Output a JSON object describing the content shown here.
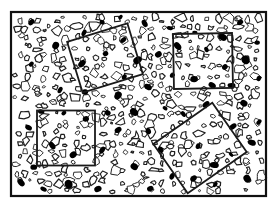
{
  "figure": {
    "background_color": "#ffffff",
    "ink_color": "#1a1a1a",
    "fill_color": "#000000",
    "canvas": {
      "width": 279,
      "height": 209
    },
    "outer_frame": {
      "label": "outer frame",
      "x": 11,
      "y": 12,
      "width": 255,
      "height": 184,
      "stroke_width": 2.2,
      "stroke_color": "#111111"
    },
    "sampling_windows": [
      {
        "name": "window-top-left",
        "label": "A",
        "cx": 105,
        "cy": 58,
        "width": 63,
        "height": 53,
        "rotation": -17,
        "stroke_width": 1.8
      },
      {
        "name": "window-top-right",
        "label": "B",
        "cx": 203,
        "cy": 61,
        "width": 59,
        "height": 55,
        "rotation": -1,
        "stroke_width": 1.8
      },
      {
        "name": "window-bottom-left",
        "label": "C",
        "cx": 66,
        "cy": 138,
        "width": 58,
        "height": 55,
        "rotation": 0,
        "stroke_width": 1.8
      },
      {
        "name": "window-bottom-right",
        "label": "D",
        "cx": 200,
        "cy": 148,
        "width": 72,
        "height": 60,
        "rotation": -35,
        "stroke_width": 1.8
      }
    ],
    "clasts": {
      "description": "irregular outlined polygon clasts filling the frame",
      "count": 470,
      "stroke_color": "#1f1f1f",
      "fill_color": "#ffffff",
      "stroke_width": 1.0,
      "min_radius": 2.0,
      "max_radius": 5.6
    },
    "dark_grains": {
      "description": "solid black rounded grains scattered across the field",
      "count": 64,
      "fill_color": "#000000",
      "min_radius_x": 2.6,
      "max_radius_x": 4.6,
      "aspect_min": 0.58,
      "aspect_max": 0.9
    },
    "seed": 20240917
  }
}
